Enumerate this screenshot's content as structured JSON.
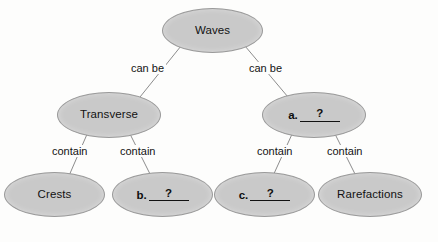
{
  "diagram": {
    "type": "concept-map",
    "colors": {
      "node_fill": "#c9c9c9",
      "node_stroke": "#9a9a9a",
      "edge_stroke": "#8c8c8c",
      "text": "#121212",
      "background": "#fdfdfc"
    },
    "nodes": [
      {
        "id": "waves",
        "label": "Waves",
        "kind": "text",
        "level": 0,
        "x": 162,
        "y": 8,
        "w": 101,
        "h": 45
      },
      {
        "id": "transverse",
        "label": "Transverse",
        "kind": "text",
        "level": 1,
        "x": 57,
        "y": 92,
        "w": 104,
        "h": 46
      },
      {
        "id": "blank-a",
        "label": "a.",
        "answer": "?",
        "kind": "blank",
        "level": 1,
        "x": 262,
        "y": 92,
        "w": 104,
        "h": 46
      },
      {
        "id": "crests",
        "label": "Crests",
        "kind": "text",
        "level": 2,
        "x": 4,
        "y": 172,
        "w": 101,
        "h": 45
      },
      {
        "id": "blank-b",
        "label": "b.",
        "answer": "?",
        "kind": "blank",
        "level": 2,
        "x": 112,
        "y": 172,
        "w": 101,
        "h": 45
      },
      {
        "id": "blank-c",
        "label": "c.",
        "answer": "?",
        "kind": "blank",
        "level": 2,
        "x": 214,
        "y": 172,
        "w": 101,
        "h": 45
      },
      {
        "id": "rarefactions",
        "label": "Rarefactions",
        "kind": "text",
        "level": 2,
        "x": 318,
        "y": 172,
        "w": 104,
        "h": 45
      }
    ],
    "edges": [
      {
        "id": "waves-transverse",
        "from": "waves",
        "to": "transverse",
        "label": "can be",
        "label_x": 129,
        "label_y": 62,
        "x1": 181,
        "y1": 46,
        "x2": 140,
        "y2": 97
      },
      {
        "id": "waves-blank-a",
        "from": "waves",
        "to": "blank-a",
        "label": "can be",
        "label_x": 247,
        "label_y": 62,
        "x1": 245,
        "y1": 46,
        "x2": 288,
        "y2": 97
      },
      {
        "id": "transverse-crests",
        "from": "transverse",
        "to": "crests",
        "label": "contain",
        "label_x": 50,
        "label_y": 145,
        "x1": 88,
        "y1": 132,
        "x2": 68,
        "y2": 178
      },
      {
        "id": "transverse-blank-b",
        "from": "transverse",
        "to": "blank-b",
        "label": "contain",
        "label_x": 118,
        "label_y": 145,
        "x1": 129,
        "y1": 132,
        "x2": 152,
        "y2": 178
      },
      {
        "id": "blank-a-blank-c",
        "from": "blank-a",
        "to": "blank-c",
        "label": "contain",
        "label_x": 255,
        "label_y": 145,
        "x1": 293,
        "y1": 132,
        "x2": 272,
        "y2": 178
      },
      {
        "id": "blank-a-rarefactions",
        "from": "blank-a",
        "to": "rarefactions",
        "label": "contain",
        "label_x": 325,
        "label_y": 145,
        "x1": 334,
        "y1": 132,
        "x2": 357,
        "y2": 178
      }
    ]
  }
}
